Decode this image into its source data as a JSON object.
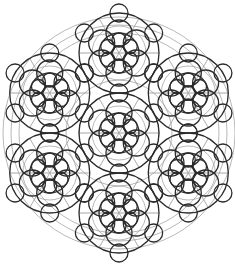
{
  "figure": {
    "background": "#ffffff",
    "stroke_dark": "#2b2b2b",
    "stroke_gray": "#9a9a9a"
  },
  "geometry": {
    "center": [
      119,
      133
    ],
    "cluster_distance": 80,
    "cluster_angles_deg": [
      90,
      30,
      -30,
      -90,
      -150,
      150
    ],
    "outer_gray_rings": [
      116,
      108,
      100
    ],
    "cluster": {
      "core_radius": 7,
      "petal_distance": 13,
      "petal_radius": 7,
      "inner_ring_radius": 20,
      "outer_ring_radius": 40,
      "tip_distance": 40,
      "tip_radius": 9,
      "gray_ring_radius": 27
    },
    "center_cluster_large_rings": [
      40,
      53
    ],
    "spoke_count": 6
  }
}
